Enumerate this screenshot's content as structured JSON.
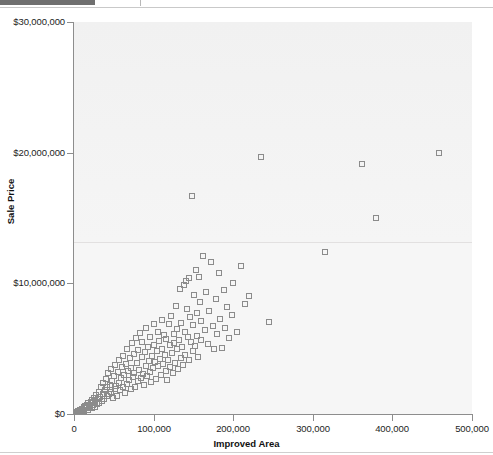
{
  "window": {
    "top_bar_accent_color": "#6f6f6f",
    "rule_color": "#c9c9c9"
  },
  "chart_data": {
    "type": "scatter",
    "title": "",
    "subtitle": "",
    "xlabel": "Improved Area",
    "ylabel": "Sale Price",
    "xlim": [
      0,
      500000
    ],
    "ylim": [
      0,
      30000000
    ],
    "xticks": [
      0,
      100000,
      200000,
      300000,
      400000,
      500000
    ],
    "xtick_labels": [
      "0",
      "100,000",
      "200,000",
      "300,000",
      "400,000",
      "500,000"
    ],
    "yticks": [
      0,
      10000000,
      20000000,
      30000000
    ],
    "ytick_labels": [
      "$0",
      "$10,000,000",
      "$20,000,000",
      "$30,000,000"
    ],
    "grid": false,
    "legend": null,
    "marker": "open-square",
    "marker_color": "#8b8b8b",
    "plot_background": "#f4f4f4",
    "series": [
      {
        "name": "Sales",
        "points": [
          [
            4000,
            120000
          ],
          [
            5000,
            200000
          ],
          [
            6000,
            180000
          ],
          [
            7000,
            260000
          ],
          [
            8000,
            320000
          ],
          [
            9000,
            150000
          ],
          [
            10000,
            410000
          ],
          [
            11000,
            300000
          ],
          [
            12000,
            520000
          ],
          [
            13000,
            260000
          ],
          [
            14000,
            620000
          ],
          [
            15000,
            430000
          ],
          [
            16000,
            700000
          ],
          [
            17000,
            330000
          ],
          [
            18000,
            810000
          ],
          [
            19000,
            520000
          ],
          [
            20000,
            640000
          ],
          [
            21000,
            900000
          ],
          [
            22000,
            470000
          ],
          [
            23000,
            1050000
          ],
          [
            24000,
            700000
          ],
          [
            25000,
            1250000
          ],
          [
            26000,
            560000
          ],
          [
            27000,
            980000
          ],
          [
            28000,
            1420000
          ],
          [
            29000,
            760000
          ],
          [
            30000,
            1150000
          ],
          [
            31000,
            1650000
          ],
          [
            32000,
            880000
          ],
          [
            33000,
            1330000
          ],
          [
            34000,
            2050000
          ],
          [
            35000,
            1010000
          ],
          [
            36000,
            1560000
          ],
          [
            37000,
            2400000
          ],
          [
            38000,
            1180000
          ],
          [
            39000,
            1820000
          ],
          [
            40000,
            2650000
          ],
          [
            41000,
            1350000
          ],
          [
            42000,
            2080000
          ],
          [
            43000,
            3100000
          ],
          [
            44000,
            1500000
          ],
          [
            45000,
            2250000
          ],
          [
            46000,
            3450000
          ],
          [
            47000,
            1700000
          ],
          [
            48000,
            2550000
          ],
          [
            49000,
            1250000
          ],
          [
            50000,
            2900000
          ],
          [
            51000,
            1900000
          ],
          [
            52000,
            3750000
          ],
          [
            53000,
            2150000
          ],
          [
            54000,
            1400000
          ],
          [
            55000,
            3250000
          ],
          [
            56000,
            2400000
          ],
          [
            57000,
            4100000
          ],
          [
            58000,
            1800000
          ],
          [
            59000,
            2750000
          ],
          [
            60000,
            3600000
          ],
          [
            61000,
            2050000
          ],
          [
            62000,
            4450000
          ],
          [
            63000,
            2950000
          ],
          [
            64000,
            1600000
          ],
          [
            65000,
            3850000
          ],
          [
            66000,
            2300000
          ],
          [
            67000,
            5000000
          ],
          [
            68000,
            3300000
          ],
          [
            69000,
            2600000
          ],
          [
            70000,
            4250000
          ],
          [
            71000,
            1900000
          ],
          [
            72000,
            3550000
          ],
          [
            73000,
            5400000
          ],
          [
            74000,
            2800000
          ],
          [
            75000,
            4600000
          ],
          [
            76000,
            3150000
          ],
          [
            77000,
            2100000
          ],
          [
            78000,
            5800000
          ],
          [
            79000,
            3900000
          ],
          [
            80000,
            2500000
          ],
          [
            81000,
            4900000
          ],
          [
            82000,
            3400000
          ],
          [
            83000,
            6200000
          ],
          [
            84000,
            2750000
          ],
          [
            85000,
            4350000
          ],
          [
            86000,
            5500000
          ],
          [
            87000,
            3050000
          ],
          [
            88000,
            2250000
          ],
          [
            89000,
            4750000
          ],
          [
            90000,
            3650000
          ],
          [
            91000,
            6600000
          ],
          [
            92000,
            2900000
          ],
          [
            93000,
            5150000
          ],
          [
            94000,
            4050000
          ],
          [
            95000,
            3250000
          ],
          [
            96000,
            5900000
          ],
          [
            97000,
            2450000
          ],
          [
            98000,
            4450000
          ],
          [
            99000,
            3500000
          ],
          [
            100000,
            6900000
          ],
          [
            101000,
            5300000
          ],
          [
            102000,
            3950000
          ],
          [
            103000,
            2700000
          ],
          [
            104000,
            4800000
          ],
          [
            105000,
            6300000
          ],
          [
            106000,
            3700000
          ],
          [
            107000,
            5600000
          ],
          [
            108000,
            4200000
          ],
          [
            109000,
            2950000
          ],
          [
            110000,
            7200000
          ],
          [
            111000,
            5000000
          ],
          [
            112000,
            3850000
          ],
          [
            113000,
            6050000
          ],
          [
            114000,
            4500000
          ],
          [
            115000,
            3300000
          ],
          [
            116000,
            5750000
          ],
          [
            117000,
            2600000
          ],
          [
            118000,
            4100000
          ],
          [
            119000,
            6850000
          ],
          [
            120000,
            5250000
          ],
          [
            121000,
            3600000
          ],
          [
            122000,
            7500000
          ],
          [
            123000,
            4700000
          ],
          [
            124000,
            3150000
          ],
          [
            125000,
            6100000
          ],
          [
            126000,
            5450000
          ],
          [
            127000,
            3900000
          ],
          [
            128000,
            8300000
          ],
          [
            129000,
            4950000
          ],
          [
            130000,
            6500000
          ],
          [
            131000,
            3450000
          ],
          [
            132000,
            5700000
          ],
          [
            133000,
            9600000
          ],
          [
            134000,
            4300000
          ],
          [
            135000,
            7000000
          ],
          [
            136000,
            5100000
          ],
          [
            137000,
            3750000
          ],
          [
            138000,
            9900000
          ],
          [
            139000,
            6300000
          ],
          [
            140000,
            4550000
          ],
          [
            141000,
            10200000
          ],
          [
            142000,
            8000000
          ],
          [
            143000,
            5900000
          ],
          [
            144000,
            4150000
          ],
          [
            145000,
            10400000
          ],
          [
            146000,
            7400000
          ],
          [
            147000,
            5500000
          ],
          [
            148000,
            16700000
          ],
          [
            149000,
            6800000
          ],
          [
            150000,
            4800000
          ],
          [
            151000,
            9100000
          ],
          [
            152000,
            5200000
          ],
          [
            153000,
            11000000
          ],
          [
            154000,
            7700000
          ],
          [
            155000,
            6000000
          ],
          [
            156000,
            4400000
          ],
          [
            157000,
            10500000
          ],
          [
            158000,
            8600000
          ],
          [
            159000,
            5650000
          ],
          [
            160000,
            7100000
          ],
          [
            162000,
            12100000
          ],
          [
            164000,
            6400000
          ],
          [
            166000,
            9300000
          ],
          [
            168000,
            5350000
          ],
          [
            170000,
            7900000
          ],
          [
            172000,
            11600000
          ],
          [
            174000,
            6700000
          ],
          [
            176000,
            4950000
          ],
          [
            178000,
            8800000
          ],
          [
            180000,
            6150000
          ],
          [
            182000,
            10800000
          ],
          [
            184000,
            7300000
          ],
          [
            186000,
            5050000
          ],
          [
            188000,
            9500000
          ],
          [
            190000,
            6550000
          ],
          [
            192000,
            8200000
          ],
          [
            195000,
            5800000
          ],
          [
            198000,
            7600000
          ],
          [
            200000,
            10000000
          ],
          [
            205000,
            6250000
          ],
          [
            210000,
            11300000
          ],
          [
            215000,
            8450000
          ],
          [
            220000,
            9050000
          ],
          [
            235000,
            19700000
          ],
          [
            245000,
            7050000
          ],
          [
            315000,
            12400000
          ],
          [
            362000,
            19100000
          ],
          [
            380000,
            15000000
          ],
          [
            458000,
            20000000
          ]
        ]
      }
    ]
  }
}
